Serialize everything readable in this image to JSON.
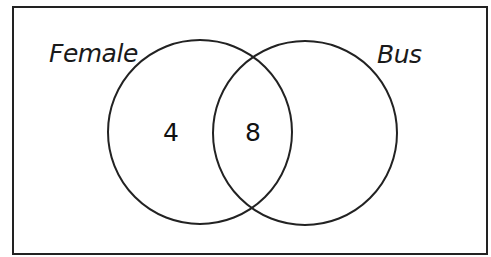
{
  "diagram": {
    "type": "venn",
    "colors": {
      "stroke": "#222222",
      "background": "#ffffff",
      "text": "#111111"
    },
    "universal_set": {
      "x": 13,
      "y": 7,
      "width": 474,
      "height": 247
    },
    "sets": [
      {
        "id": "female",
        "label": "Female",
        "circle": {
          "cx": 200,
          "cy": 132,
          "r": 92
        },
        "label_pos": {
          "x": 49,
          "y": 62
        }
      },
      {
        "id": "bus",
        "label": "Bus",
        "circle": {
          "cx": 305,
          "cy": 133,
          "r": 92
        },
        "label_pos": {
          "x": 377,
          "y": 63
        }
      }
    ],
    "regions": [
      {
        "id": "female-only",
        "value": "4",
        "pos": {
          "x": 171,
          "y": 141
        }
      },
      {
        "id": "female-and-bus",
        "value": "8",
        "pos": {
          "x": 253,
          "y": 141
        }
      }
    ]
  }
}
